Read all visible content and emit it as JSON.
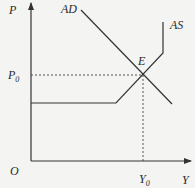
{
  "diagram": {
    "type": "AD-AS model",
    "axes": {
      "y_label": "P",
      "x_label": "Y",
      "origin_label": "O"
    },
    "curves": [
      {
        "name": "AD",
        "label": "AD",
        "description": "downward-sloping aggregate demand line"
      },
      {
        "name": "AS",
        "label": "AS",
        "description": "aggregate supply: horizontal segment, upward-sloping segment, then vertical segment"
      }
    ],
    "equilibrium": {
      "label": "E",
      "price_label": "P",
      "price_sub": "0",
      "output_label": "Y",
      "output_sub": "0"
    },
    "colors": {
      "line": "#333333",
      "background": "#f4f4f2"
    }
  }
}
